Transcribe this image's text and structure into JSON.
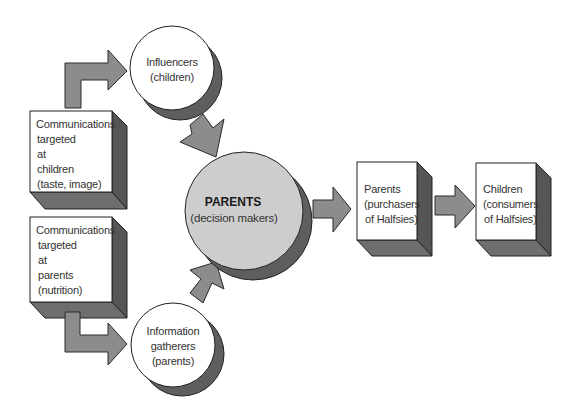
{
  "diagram": {
    "nodes": {
      "comm_children": {
        "shape": "3d-box",
        "lines": [
          "Communications",
          "targeted",
          "at",
          "children",
          "(taste, image)"
        ]
      },
      "comm_parents": {
        "shape": "3d-box",
        "lines": [
          "Communications",
          "targeted",
          "at",
          "parents",
          "(nutrition)"
        ]
      },
      "influencers": {
        "shape": "circle",
        "lines": [
          "Influencers",
          "(children)"
        ]
      },
      "info_gatherers": {
        "shape": "circle",
        "lines": [
          "Information",
          "gatherers",
          "(parents)"
        ]
      },
      "parents_decision": {
        "shape": "circle",
        "title": "PARENTS",
        "lines": [
          "(decision makers)"
        ]
      },
      "parents_purchasers": {
        "shape": "3d-box",
        "lines": [
          "Parents",
          "(purchasers",
          "of Halfsies)"
        ]
      },
      "children_consumers": {
        "shape": "3d-box",
        "lines": [
          "Children",
          "(consumers",
          "of Halfsies)"
        ]
      }
    },
    "edges": [
      {
        "from": "comm_children",
        "to": "influencers",
        "style": "elbow-arrow"
      },
      {
        "from": "comm_parents",
        "to": "info_gatherers",
        "style": "elbow-arrow"
      },
      {
        "from": "influencers",
        "to": "parents_decision",
        "style": "block-arrow"
      },
      {
        "from": "info_gatherers",
        "to": "parents_decision",
        "style": "block-arrow"
      },
      {
        "from": "parents_decision",
        "to": "parents_purchasers",
        "style": "block-arrow"
      },
      {
        "from": "parents_purchasers",
        "to": "children_consumers",
        "style": "block-arrow"
      }
    ],
    "colors": {
      "arrow": "#8c8c8c",
      "box_side": "#555555",
      "box_bottom": "#6e6e6e",
      "central_circle": "#cdcdcd",
      "shadow": "#5e5e5e",
      "outline": "#222222",
      "background": "#ffffff"
    }
  }
}
